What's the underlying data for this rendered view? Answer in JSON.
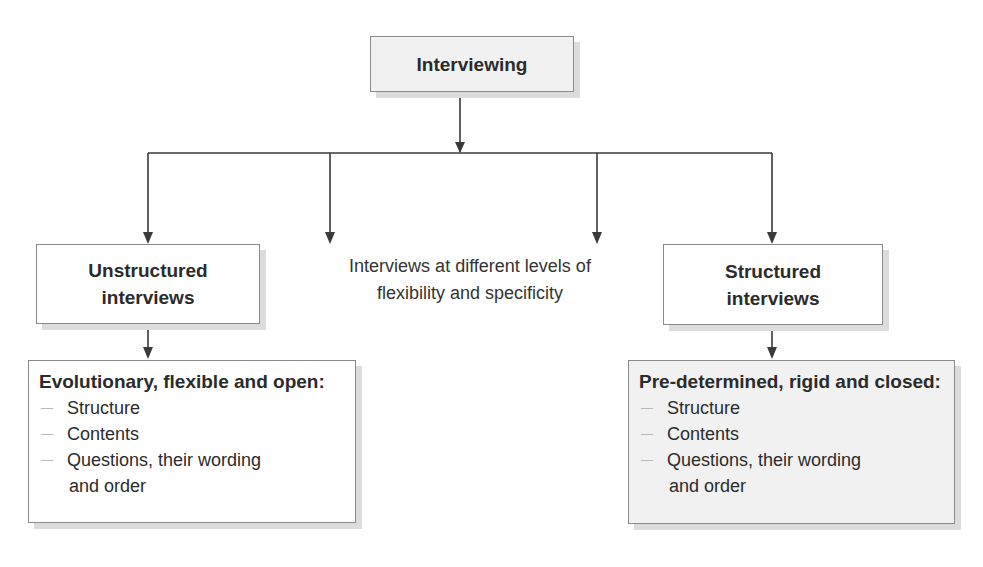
{
  "diagram": {
    "root": {
      "label": "Interviewing"
    },
    "middle_note": {
      "line1": "Interviews at different levels of",
      "line2": "flexibility and specificity"
    },
    "left": {
      "title_line1": "Unstructured",
      "title_line2": "interviews",
      "detail": {
        "heading": "Evolutionary,  flexible and open:",
        "items": [
          "Structure",
          "Contents",
          "Questions, their wording"
        ],
        "continuation": "and order"
      }
    },
    "right": {
      "title_line1": "Structured",
      "title_line2": "interviews",
      "detail": {
        "heading": "Pre-determined, rigid and closed:",
        "items": [
          "Structure",
          "Contents",
          "Questions, their wording"
        ],
        "continuation": "and order"
      }
    },
    "bullet_glyph": "—",
    "colors": {
      "line": "#3a3a3a",
      "box_border": "#8a8a8a",
      "gray_fill": "#f1f1f1",
      "shadow": "#dcdcdc"
    }
  }
}
